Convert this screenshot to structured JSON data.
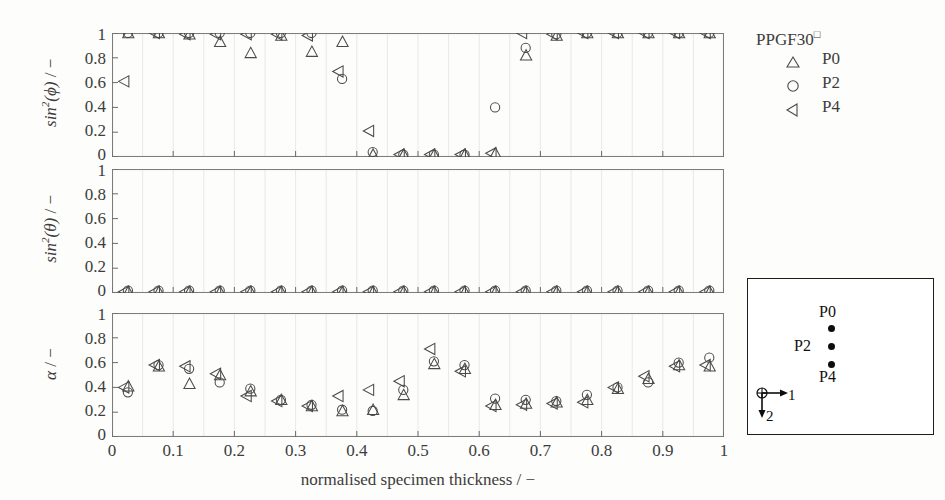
{
  "figure": {
    "xaxis_title": "normalised specimen thickness / −",
    "xticks": [
      "0",
      "0.1",
      "0.2",
      "0.3",
      "0.4",
      "0.5",
      "0.6",
      "0.7",
      "0.8",
      "0.9",
      "1"
    ],
    "xlim": [
      0,
      1
    ],
    "yticks": [
      "0",
      "0.2",
      "0.4",
      "0.6",
      "0.8",
      "1"
    ],
    "ylim": [
      0,
      1
    ]
  },
  "legend": {
    "title": "PPGF30",
    "title_sup": "□",
    "entries": [
      {
        "marker": "triangle-up",
        "label": "P0"
      },
      {
        "marker": "circle",
        "label": "P2"
      },
      {
        "marker": "triangle-left",
        "label": "P4"
      }
    ]
  },
  "schematic": {
    "points": [
      {
        "label": "P0",
        "label_side": "above"
      },
      {
        "label": "P2",
        "label_side": "left"
      },
      {
        "label": "P4",
        "label_side": "below"
      }
    ],
    "axis1_label": "1",
    "axis2_label": "2",
    "origin_symbol": "⊕"
  },
  "chart_data": [
    {
      "type": "scatter",
      "panel": 1,
      "title": "",
      "xlabel": "normalised specimen thickness / −",
      "ylabel": "sin²(ϕ) / −",
      "ylabel_parts": {
        "base": "sin",
        "exp": "2",
        "arg": "(ϕ)",
        "unit": "/ −"
      },
      "xlim": [
        0,
        1
      ],
      "ylim": [
        0,
        1
      ],
      "grid": "vertical-light",
      "x": [
        0.025,
        0.075,
        0.125,
        0.175,
        0.225,
        0.275,
        0.325,
        0.375,
        0.425,
        0.475,
        0.525,
        0.575,
        0.625,
        0.675,
        0.725,
        0.775,
        0.825,
        0.875,
        0.925,
        0.975
      ],
      "series": [
        {
          "name": "P0",
          "marker": "triangle-up",
          "values": [
            1.0,
            1.0,
            0.99,
            0.93,
            0.84,
            0.98,
            0.85,
            0.93,
            0.02,
            0.02,
            0.02,
            0.02,
            0.03,
            0.82,
            0.98,
            1.0,
            1.0,
            1.0,
            1.0,
            1.0
          ]
        },
        {
          "name": "P2",
          "marker": "circle",
          "values": [
            1.0,
            1.0,
            1.0,
            1.0,
            1.0,
            1.0,
            1.0,
            0.63,
            0.04,
            0.02,
            0.02,
            0.02,
            0.4,
            0.88,
            0.99,
            1.0,
            1.0,
            1.0,
            1.0,
            1.0
          ]
        },
        {
          "name": "P4",
          "marker": "triangle-left",
          "values": [
            0.61,
            1.0,
            0.99,
            0.99,
            0.99,
            0.99,
            0.98,
            0.69,
            0.21,
            0.02,
            0.02,
            0.02,
            0.03,
            1.0,
            0.99,
            1.0,
            1.0,
            1.0,
            1.0,
            1.0
          ]
        }
      ]
    },
    {
      "type": "scatter",
      "panel": 2,
      "title": "",
      "xlabel": "normalised specimen thickness / −",
      "ylabel": "sin²(θ) / −",
      "ylabel_parts": {
        "base": "sin",
        "exp": "2",
        "arg": "(θ)",
        "unit": "/ −"
      },
      "xlim": [
        0,
        1
      ],
      "ylim": [
        0,
        1
      ],
      "grid": "vertical-light",
      "x": [
        0.025,
        0.075,
        0.125,
        0.175,
        0.225,
        0.275,
        0.325,
        0.375,
        0.425,
        0.475,
        0.525,
        0.575,
        0.625,
        0.675,
        0.725,
        0.775,
        0.825,
        0.875,
        0.925,
        0.975
      ],
      "series": [
        {
          "name": "P0",
          "marker": "triangle-up",
          "values": [
            0.01,
            0.01,
            0.01,
            0.01,
            0.01,
            0.01,
            0.01,
            0.01,
            0.01,
            0.01,
            0.01,
            0.01,
            0.01,
            0.01,
            0.01,
            0.01,
            0.01,
            0.01,
            0.01,
            0.01
          ]
        },
        {
          "name": "P2",
          "marker": "circle",
          "values": [
            0.02,
            0.02,
            0.02,
            0.02,
            0.02,
            0.02,
            0.02,
            0.02,
            0.02,
            0.02,
            0.02,
            0.02,
            0.02,
            0.02,
            0.02,
            0.02,
            0.02,
            0.02,
            0.02,
            0.02
          ]
        },
        {
          "name": "P4",
          "marker": "triangle-left",
          "values": [
            0.01,
            0.01,
            0.01,
            0.01,
            0.01,
            0.01,
            0.01,
            0.01,
            0.01,
            0.01,
            0.01,
            0.01,
            0.01,
            0.01,
            0.01,
            0.01,
            0.01,
            0.01,
            0.01,
            0.01
          ]
        }
      ]
    },
    {
      "type": "scatter",
      "panel": 3,
      "title": "",
      "xlabel": "normalised specimen thickness / −",
      "ylabel": "α / −",
      "ylabel_parts": {
        "base": "α",
        "exp": "",
        "arg": "",
        "unit": "/ −"
      },
      "xlim": [
        0,
        1
      ],
      "ylim": [
        0,
        1
      ],
      "grid": "vertical-light",
      "x": [
        0.025,
        0.075,
        0.125,
        0.175,
        0.225,
        0.275,
        0.325,
        0.375,
        0.425,
        0.475,
        0.525,
        0.575,
        0.625,
        0.675,
        0.725,
        0.775,
        0.825,
        0.875,
        0.925,
        0.975
      ],
      "series": [
        {
          "name": "P0",
          "marker": "triangle-up",
          "values": [
            0.41,
            0.57,
            0.43,
            0.5,
            0.37,
            0.3,
            0.25,
            0.21,
            0.22,
            0.34,
            0.59,
            0.55,
            0.26,
            0.27,
            0.28,
            0.3,
            0.39,
            0.47,
            0.58,
            0.57
          ]
        },
        {
          "name": "P2",
          "marker": "circle",
          "values": [
            0.36,
            0.58,
            0.55,
            0.44,
            0.39,
            0.3,
            0.26,
            0.22,
            0.21,
            0.38,
            0.61,
            0.58,
            0.31,
            0.3,
            0.29,
            0.34,
            0.4,
            0.44,
            0.6,
            0.64
          ]
        },
        {
          "name": "P4",
          "marker": "triangle-left",
          "values": [
            0.4,
            0.58,
            0.57,
            0.51,
            0.33,
            0.29,
            0.25,
            0.33,
            0.38,
            0.45,
            0.71,
            0.53,
            0.25,
            0.26,
            0.27,
            0.28,
            0.4,
            0.49,
            0.57,
            0.58
          ]
        }
      ]
    }
  ]
}
